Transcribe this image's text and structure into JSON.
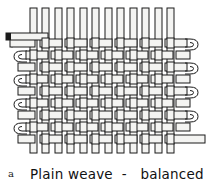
{
  "figure": {
    "label": "a",
    "caption": "Plain weave  -   balanced",
    "caption_parts": {
      "name": "Plain weave",
      "separator": "-",
      "qualifier": "balanced"
    },
    "title": "Plain weave - balanced",
    "diagram_type": "textile-weave-diagram",
    "weave_structure": "plain weave (tabby), balanced",
    "colors": {
      "ink": "#1a1a1a",
      "thread_fill": "#f4f4f2",
      "shadow": "#8a8a8a",
      "background": "#ffffff"
    },
    "threads": {
      "warp_label": "warp",
      "warp_count": 8,
      "warp_orientation": "vertical",
      "weft_label": "weft",
      "weft_count": 9,
      "weft_orientation": "horizontal",
      "selvedge_left_loops": 5,
      "selvedge_right_loops": 4,
      "interlacement": "over-one-under-one",
      "balanced": true
    },
    "tails": {
      "top_left": "weft thread tail protruding at upper left",
      "bottom_right": "weft thread tail protruding at lower right"
    }
  }
}
